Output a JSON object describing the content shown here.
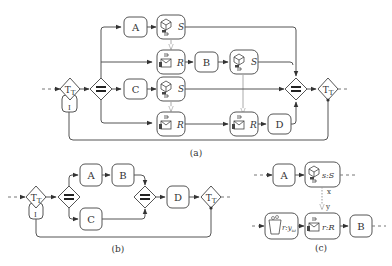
{
  "figure": {
    "captions": {
      "a": "(a)",
      "b": "(b)",
      "c": "(c)"
    },
    "diagram_a": {
      "tasks": {
        "A": "A",
        "B": "B",
        "C": "C",
        "D": "D"
      },
      "send_label": "S",
      "receive_label": "R",
      "loop_marker": "I",
      "transaction_label": "T"
    },
    "diagram_b": {
      "tasks": {
        "A": "A",
        "B": "B",
        "C": "C",
        "D": "D"
      },
      "loop_marker": "I",
      "transaction_label": "T"
    },
    "diagram_c": {
      "tasks": {
        "A": "A",
        "B": "B"
      },
      "send_label": "s:S",
      "receive_label": "r:R",
      "collect_label": "r:y",
      "collect_sub": "ω",
      "edge_x": "x",
      "edge_y": "y"
    }
  }
}
